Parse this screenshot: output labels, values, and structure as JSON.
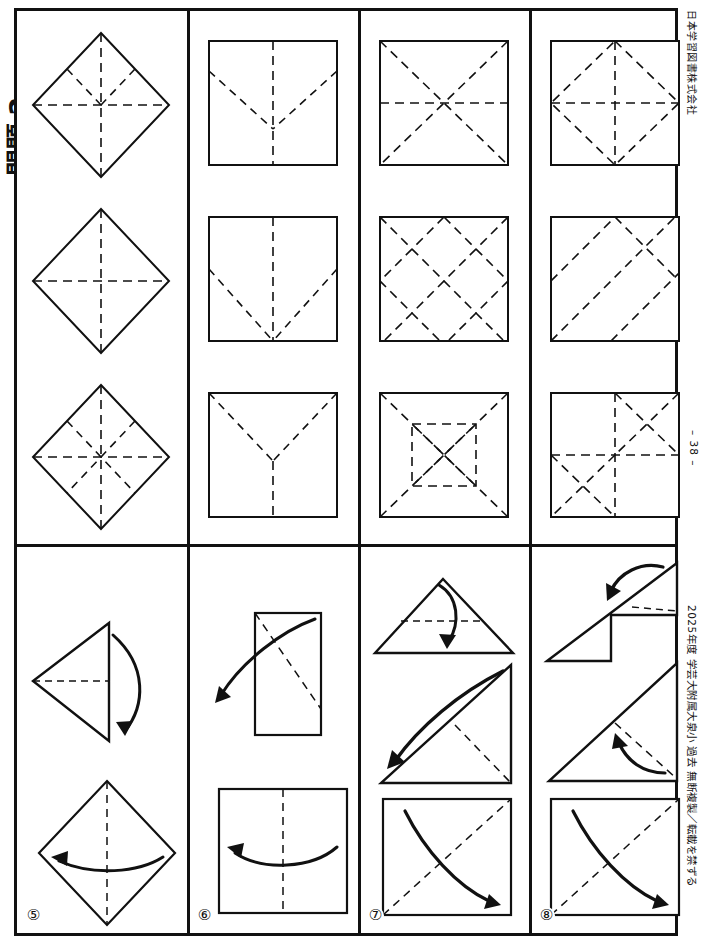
{
  "page": {
    "publisher": "日本学習図書株式会社",
    "copyright": "2025年度 学芸大附属大泉小 過去 無断複製／転載を禁ずる",
    "page_number": "– 38 –",
    "title_fragment": "問題 2"
  },
  "top_block": {
    "columns": [
      {
        "id": "col-1",
        "panels": [
          {
            "id": "p1-1",
            "shape": "diamond",
            "creases": "vertical-horizontal-upper-diagonals"
          },
          {
            "id": "p1-2",
            "shape": "diamond",
            "creases": "vertical-horizontal"
          },
          {
            "id": "p1-3",
            "shape": "diamond",
            "creases": "eight-way-star"
          }
        ]
      },
      {
        "id": "col-2",
        "panels": [
          {
            "id": "p2-1",
            "shape": "square",
            "creases": "v-fold-with-lower-vertical"
          },
          {
            "id": "p2-2",
            "shape": "square",
            "creases": "v-fold-to-bottom-with-upper-vertical"
          },
          {
            "id": "p2-3",
            "shape": "square",
            "creases": "v-fold-from-top-corners-with-lower-vertical"
          }
        ]
      },
      {
        "id": "col-3",
        "panels": [
          {
            "id": "p3-1",
            "shape": "square",
            "creases": "diagonals-and-horizontal"
          },
          {
            "id": "p3-2",
            "shape": "square",
            "creases": "diagonal-lattice"
          },
          {
            "id": "p3-3",
            "shape": "square",
            "creases": "inner-square-with-x"
          }
        ]
      },
      {
        "id": "col-4",
        "panels": [
          {
            "id": "p4-1",
            "shape": "square",
            "creases": "inscribed-diamond-with-cross"
          },
          {
            "id": "p4-2",
            "shape": "square",
            "creases": "parallel-diagonal-stripes"
          },
          {
            "id": "p4-3",
            "shape": "square",
            "creases": "cross-with-two-quadrant-x"
          }
        ]
      }
    ]
  },
  "bottom_block": {
    "columns": [
      {
        "id": "step-5",
        "number": "⑤",
        "steps": [
          {
            "id": "s5-1",
            "shape": "left-triangle",
            "arrow": "fold-right-down"
          },
          {
            "id": "s5-2",
            "shape": "diamond",
            "arrow": "fold-left"
          }
        ]
      },
      {
        "id": "step-6",
        "number": "⑥",
        "steps": [
          {
            "id": "s6-1",
            "shape": "tall-rectangle",
            "arrow": "unfold-lower-left"
          },
          {
            "id": "s6-2",
            "shape": "square",
            "arrow": "unfold-left"
          }
        ]
      },
      {
        "id": "step-7",
        "number": "⑦",
        "steps": [
          {
            "id": "s7-1",
            "shape": "wide-triangle",
            "arrow": "fold-down"
          },
          {
            "id": "s7-2",
            "shape": "right-triangle",
            "arrow": "unfold-lower-left"
          },
          {
            "id": "s7-3",
            "shape": "square",
            "arrow": "unfold-lower-right"
          }
        ]
      },
      {
        "id": "step-8",
        "number": "⑧",
        "steps": [
          {
            "id": "s8-1",
            "shape": "z-folded-triangle",
            "arrow": "fold-left-down"
          },
          {
            "id": "s8-2",
            "shape": "right-triangle",
            "arrow": "unfold-up-left"
          },
          {
            "id": "s8-3",
            "shape": "square",
            "arrow": "unfold-lower-right"
          }
        ]
      }
    ]
  }
}
